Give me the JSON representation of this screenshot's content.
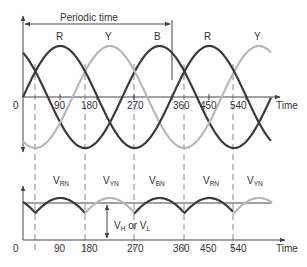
{
  "top_plot": {
    "periodic_time_label": "Periodic time",
    "phase_labels": [
      "R",
      "Y",
      "B",
      "R",
      "Y"
    ],
    "origin_label": "0",
    "x_ticks": [
      "90",
      "180",
      "270",
      "360",
      "450",
      "540"
    ],
    "x_axis_label": "Time"
  },
  "bottom_plot": {
    "segment_labels": [
      {
        "main": "V",
        "sub": "RN"
      },
      {
        "main": "V",
        "sub": "YN"
      },
      {
        "main": "V",
        "sub": "BN"
      },
      {
        "main": "V",
        "sub": "RN"
      },
      {
        "main": "V",
        "sub": "YN"
      }
    ],
    "dc_label_main1": "V",
    "dc_label_sub1": "H",
    "dc_label_or": " or ",
    "dc_label_main2": "V",
    "dc_label_sub2": "L",
    "origin_label": "0",
    "x_ticks": [
      "90",
      "180",
      "270",
      "360",
      "450",
      "540"
    ],
    "x_axis_label": "Time"
  },
  "colors": {
    "dark_wave": "#3a3a3a",
    "light_wave": "#b8b8b8",
    "axis": "#444444",
    "dashed": "#8a8a8a"
  }
}
